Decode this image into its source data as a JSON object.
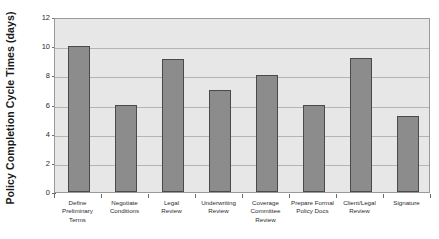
{
  "chart_data": {
    "type": "bar",
    "title": "",
    "xlabel": "",
    "ylabel": "Policy Completion Cycle Times (days)",
    "ylim": [
      0,
      12
    ],
    "yticks": [
      0,
      2,
      4,
      6,
      8,
      10,
      12
    ],
    "ytick_labels": [
      "0",
      "2",
      "4",
      "6",
      "8",
      "10",
      "12"
    ],
    "grid": true,
    "legend": "none",
    "categories": [
      "Define Preliminary Terms",
      "Negotiate Conditions",
      "Legal Review",
      "Underwriting Review",
      "Coverage Committee Review",
      "Prepare Formal Policy Docs",
      "Client/Legal Review",
      "Signature"
    ],
    "category_lines": [
      "Define\nPreliminary\nTerms",
      "Negotiate\nConditions",
      "Legal\nReview",
      "Underwriting\nReview",
      "Coverage\nCommittee\nReview",
      "Prepare Formal\nPolicy Docs",
      "Client/Legal\nReview",
      "Signature"
    ],
    "values": [
      10,
      6,
      9.1,
      7,
      8,
      6,
      9.2,
      5.2
    ],
    "series": [
      {
        "name": "Cycle Time",
        "values": [
          10,
          6,
          9.1,
          7,
          8,
          6,
          9.2,
          5.2
        ]
      }
    ]
  },
  "style": {
    "bar_fill": "#8c8c8c",
    "bar_stroke": "#4a4a4a",
    "plot_background": "#e7e7e7",
    "plot_border": "#9a9a9a",
    "gridline_color": "#b4b4b4",
    "text_color": "#2b2b2b",
    "title_color": "#1a1a1a",
    "page_background": "#ffffff"
  }
}
